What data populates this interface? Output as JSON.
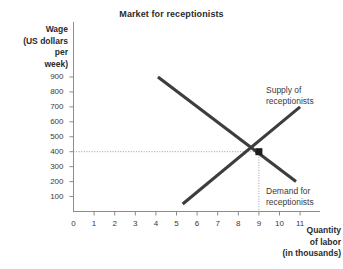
{
  "chart": {
    "title": "Market for receptionists",
    "y_axis_title_lines": [
      "Wage",
      "(US dollars",
      "per",
      "week)"
    ],
    "x_axis_title_lines": [
      "Quantity",
      "of labor",
      "(in thousands)"
    ],
    "supply_label_lines": [
      "Supply of",
      "receptionists"
    ],
    "demand_label_lines": [
      "Demand for",
      "receptionists"
    ]
  },
  "chart_data": {
    "type": "line",
    "title": "Market for receptionists",
    "xlabel": "Quantity of labor (in thousands)",
    "ylabel": "Wage (US dollars per week)",
    "xlim": [
      0,
      11.6
    ],
    "ylim": [
      0,
      960
    ],
    "grid": false,
    "legend": "inline-annotations",
    "xticks": [
      "0",
      "1",
      "2",
      "3",
      "4",
      "5",
      "6",
      "7",
      "8",
      "9",
      "10",
      "11"
    ],
    "xtick_values": [
      0,
      1,
      2,
      3,
      4,
      5,
      6,
      7,
      8,
      9,
      10,
      11
    ],
    "yticks": [
      "100",
      "200",
      "300",
      "400",
      "500",
      "600",
      "700",
      "800",
      "900"
    ],
    "ytick_values": [
      100,
      200,
      300,
      400,
      500,
      600,
      700,
      800,
      900
    ],
    "series": [
      {
        "name": "Supply of receptionists",
        "label": "Supply of receptionists",
        "color": "#3d3d3d",
        "x": [
          5.3,
          11.0
        ],
        "y": [
          50,
          700
        ]
      },
      {
        "name": "Demand for receptionists",
        "label": "Demand for receptionists",
        "color": "#3d3d3d",
        "x": [
          4.1,
          10.8
        ],
        "y": [
          900,
          200
        ]
      }
    ],
    "annotations": [
      {
        "name": "equilibrium-point",
        "x": 9,
        "y": 400,
        "marker": "filled-square-dot",
        "guides": [
          "horizontal-dotted-to-y-axis",
          "vertical-dotted-to-x-axis"
        ]
      }
    ]
  }
}
